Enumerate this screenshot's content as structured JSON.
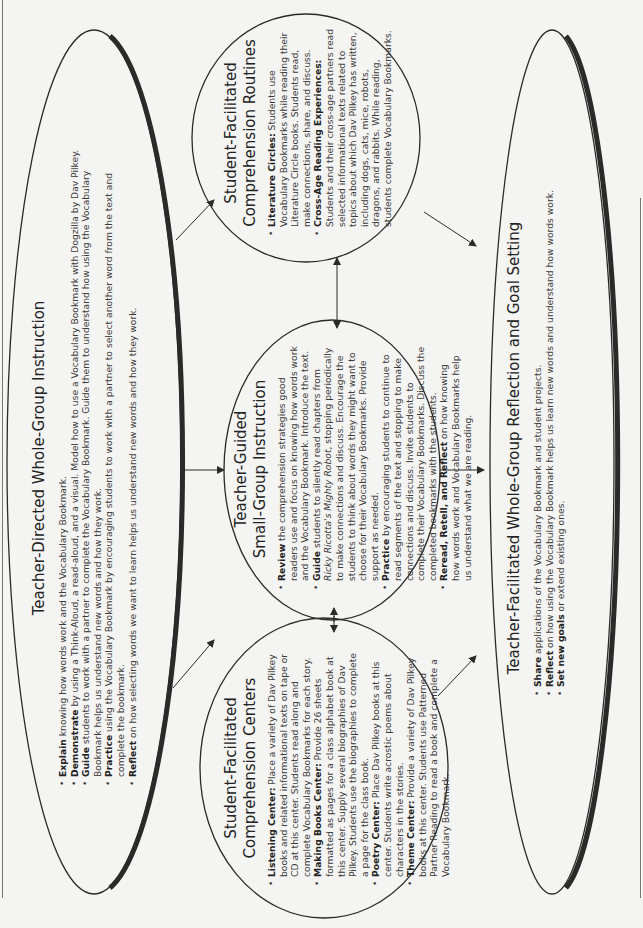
{
  "diagram": {
    "whole_group_instruction": {
      "title": "Teacher-Directed Whole-Group Instruction",
      "items": [
        {
          "lead": "Explain",
          "text": " knowing how words work and the Vocabulary Bookmark."
        },
        {
          "lead": "Demonstrate",
          "text": " by using a Think-Aloud, a read-aloud, and a visual. Model how to use a Vocabulary Bookmark with Dogzilla by Dav Pilkey."
        },
        {
          "lead": "Guide",
          "text": " students to work with a partner to complete the Vocabulary Bookmark. Guide them to understand how using the Vocabulary Bookmark helps us understand new words and how they work."
        },
        {
          "lead": "Practice",
          "text": " using the Vocabulary Bookmark by encouraging students to work with a partner to select another word from the text and complete the bookmark."
        },
        {
          "lead": "Reflect",
          "text": " on how selecting words we want to learn helps us understand new words and how they work."
        }
      ]
    },
    "comprehension_routines": {
      "title_line1": "Student-Facilitated",
      "title_line2": "Comprehension Routines",
      "items": [
        {
          "lead": "Literature Circles:",
          "text": " Students use Vocabulary Bookmarks while reading their Literature Circle books. Students read, make connections, share, and discuss."
        },
        {
          "lead": "Cross-Age Reading Experiences:",
          "text": " Students and their cross-age partners read selected informational texts related to topics about which Dav Pilkey has written, including dogs, cats, mice, robots, dragons, and rabbits. While reading, students complete Vocabulary Bookmarks."
        }
      ]
    },
    "small_group_instruction": {
      "title_line1": "Teacher-Guided",
      "title_line2": "Small-Group Instruction",
      "items": [
        {
          "lead": "Review",
          "text": " the comprehension strategies good readers use and focus on knowing how words work and the Vocabulary Bookmark. Introduce the text."
        },
        {
          "lead": "Guide",
          "text": " students to silently read chapters from ",
          "italic": "Ricky Ricotta's Mighty Robot",
          "text2": ", stopping periodically to make connections and discuss. Encourage the students to think about words they might want to choose for their Vocabulary Bookmarks. Provide support as needed."
        },
        {
          "lead": "Practice",
          "text": " by encouraging students to continue to read segments of the text and stopping to make connections and discuss. Invite students to complete their Vocabulary Bookmarks. Discuss the completed bookmarks with the students."
        },
        {
          "lead": "Reread, Retell, and Reflect",
          "text": " on how knowing how words work and Vocabulary Bookmarks help us understand what we are reading."
        }
      ]
    },
    "comprehension_centers": {
      "title_line1": "Student-Facilitated",
      "title_line2": "Comprehension Centers",
      "items": [
        {
          "lead": "Listening Center:",
          "text": " Place a variety of Dav Pilkey books and related informational texts on tape or CD at this center. Students read along and complete Vocabulary Bookmarks for each story."
        },
        {
          "lead": "Making Books Center:",
          "text": " Provide 26 sheets formatted as pages for a class alphabet book at this center. Supply several biographies of Dav Pilkey. Students use the biographies to complete a page for the class book."
        },
        {
          "lead": "Poetry Center:",
          "text": " Place Dav Pilkey books at this center. Students write acrostic poems about characters in the stories."
        },
        {
          "lead": "Theme Center:",
          "text": " Provide a variety of Dav Pilkey books at this center. Students use Patterned Partner Reading to read a book and complete a Vocabulary Bookmark."
        }
      ]
    },
    "reflection_goal_setting": {
      "title": "Teacher-Facilitated Whole-Group Reflection and Goal Setting",
      "items": [
        {
          "lead": "Share",
          "text": " applications of the Vocabulary Bookmark and student projects."
        },
        {
          "lead": "Reflect",
          "text": " on how using the Vocabulary Bookmark helps us learn new words and understand how words work."
        },
        {
          "lead": "Set new goals",
          "text": " or extend existing ones."
        }
      ]
    },
    "colors": {
      "line": "#2a2a2a",
      "background": "#f4f4f2",
      "text": "#3a3a3a"
    }
  }
}
